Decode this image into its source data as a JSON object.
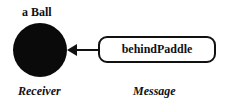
{
  "diagram": {
    "receiver_object_label": "a Ball",
    "message_label": "behindPaddle",
    "receiver_caption": "Receiver",
    "message_caption": "Message",
    "colors": {
      "ball": "#0a0a0a",
      "stroke": "#111111",
      "background": "#ffffff"
    }
  }
}
